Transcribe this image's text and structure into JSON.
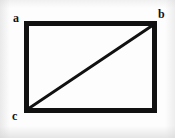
{
  "figure": {
    "kind": "geometry-diagram",
    "background_color": "#fdfdfd",
    "stroke_color": "#111111",
    "canvas": {
      "width": 175,
      "height": 138
    },
    "rectangle": {
      "name": "rectangle-outline",
      "x": 24,
      "y": 21,
      "width": 133,
      "height": 92,
      "stroke_width": 5,
      "fill": "none"
    },
    "diagonal": {
      "name": "diagonal-c-to-b",
      "from": "c",
      "to": "b",
      "x1": 27,
      "y1": 110,
      "x2": 154,
      "y2": 24,
      "stroke_width": 3
    },
    "vertices": [
      {
        "id": "a",
        "label": "a",
        "corner": "top-left",
        "x": 24,
        "y": 21
      },
      {
        "id": "b",
        "label": "b",
        "corner": "top-right",
        "x": 157,
        "y": 21
      },
      {
        "id": "c",
        "label": "c",
        "corner": "bottom-left",
        "x": 24,
        "y": 113
      }
    ]
  }
}
